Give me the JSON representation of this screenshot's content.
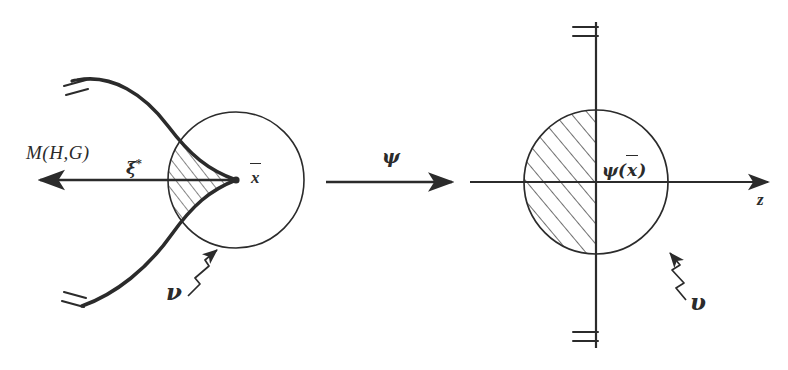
{
  "figure": {
    "domain_type": "math-diagram",
    "background_color": "#ffffff",
    "ink_color": "#2b2b2b",
    "width": 788,
    "height": 370
  },
  "left_panel": {
    "curve_label": "M(H,G)",
    "tangent_vector_label": "ξ",
    "tangent_vector_superscript": "*",
    "point_label": "x",
    "point_has_overline": true,
    "neighborhood_label": "ν",
    "circle": {
      "cx": 236,
      "cy": 180,
      "r": 68
    },
    "cusp_point": {
      "x": 236,
      "y": 180
    },
    "arrow_tip": {
      "x": 36,
      "y": 180
    },
    "break_marks": 2
  },
  "map_arrow": {
    "label": "ψ",
    "from_x": 324,
    "to_x": 452,
    "y": 182
  },
  "right_panel": {
    "image_point_label": "ψ(x)",
    "image_point_has_overline": true,
    "axis_label": "z",
    "neighborhood_label": "υ",
    "circle": {
      "cx": 596,
      "cy": 182,
      "r": 72
    },
    "vertical_line": {
      "x": 596,
      "y_top": 22,
      "y_bottom": 348
    },
    "horizontal_axis": {
      "y": 182,
      "x_start": 470,
      "x_end": 772
    },
    "hatched_half": "left",
    "break_marks": 2
  }
}
